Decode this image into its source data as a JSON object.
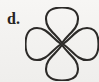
{
  "figure": {
    "part_label": "d.",
    "caption": "",
    "background_color": "#f3f2f0",
    "ink_color": "#2c2a28",
    "shape_name": "four-petal-flower",
    "shape_description": "Four-petaled flower outline (quatrefoil / four-petal rose curve) with petals pointing up, right, down and left meeting at a common center point",
    "petal_count": 4,
    "petals": [
      {
        "name": "top-petal",
        "direction": "up",
        "angle_degrees": 90
      },
      {
        "name": "right-petal",
        "direction": "right",
        "angle_degrees": 0
      },
      {
        "name": "bottom-petal",
        "direction": "down",
        "angle_degrees": 270
      },
      {
        "name": "left-petal",
        "direction": "left",
        "angle_degrees": 180
      }
    ],
    "geometry": {
      "center_x": 37,
      "center_y": 36,
      "petal_reach": 34,
      "petal_half_width": 19,
      "stroke_width": 2.1,
      "viewbox": "0 0 74 74"
    },
    "paths": {
      "top_petal": "M 37 36 C 30 26 21 22 21 12 C 21 3 29 0.5 37 0.5 C 45 0.5 53 3 53 12 C 53 22 44 26 37 36 Z",
      "right_petal": "M 38 37 C 48 30 52 21 62 21 C 71 21 73.5 29 73.5 37 C 73.5 45 71 53 62 53 C 52 53 48 44 38 37 Z",
      "bottom_petal": "M 37 38 C 44 48 53 52 53 62 C 53 71 45 73.5 37 73.5 C 29 73.5 21 71 21 62 C 21 52 30 48 37 38 Z",
      "left_petal": "M 36 37 C 26 44 22 53 12 53 C 3 53 0.5 45 0.5 37 C 0.5 29 3 21 12 21 C 22 21 26 30 36 37 Z"
    }
  }
}
